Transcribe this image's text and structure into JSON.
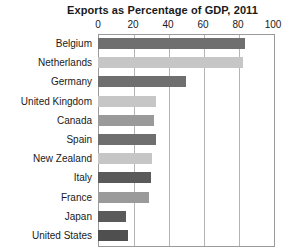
{
  "chart_data": {
    "type": "bar",
    "orientation": "horizontal",
    "title": "Exports as Percentage of GDP, 2011",
    "xlabel": "",
    "ylabel": "",
    "xlim": [
      0,
      100
    ],
    "xticks": [
      0,
      20,
      40,
      60,
      80,
      100
    ],
    "xtick_labels": [
      "0",
      "20",
      "40",
      "60",
      "80",
      "100"
    ],
    "grid": true,
    "grid_axis": "x",
    "legend": false,
    "categories": [
      "Belgium",
      "Netherlands",
      "Germany",
      "United Kingdom",
      "Canada",
      "Spain",
      "New Zealand",
      "Italy",
      "France",
      "Japan",
      "United States"
    ],
    "values": [
      84,
      83,
      50,
      33,
      32,
      33,
      31,
      30,
      29,
      16,
      17
    ],
    "bar_colors": [
      "#6f6f6f",
      "#c6c6c6",
      "#6f6f6f",
      "#c6c6c6",
      "#9a9a9a",
      "#6f6f6f",
      "#c6c6c6",
      "#5a5a5a",
      "#9a9a9a",
      "#5a5a5a",
      "#4f4f4f"
    ],
    "plot_background": "#ffffff",
    "border_color": "#9a9a9a",
    "gridline_color": "#b4b4b4",
    "text_color": "#1a1a1a"
  }
}
